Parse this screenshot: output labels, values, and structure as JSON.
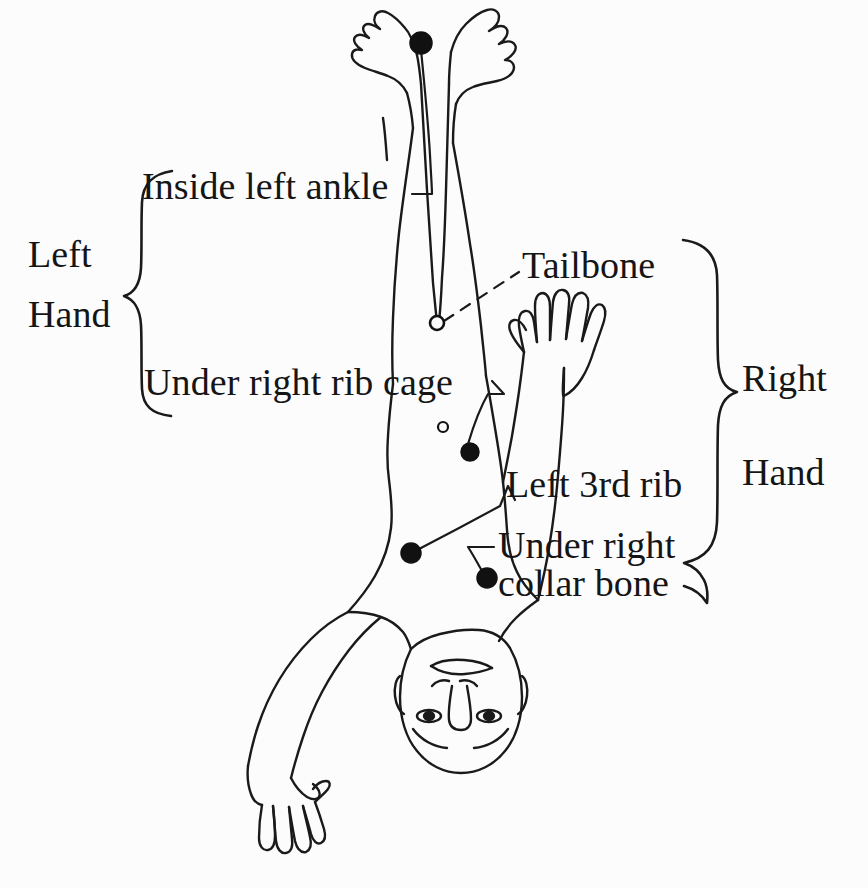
{
  "diagram": {
    "orientation": "inverted",
    "background_color": "#fcfcfc",
    "ink_color": "#151515"
  },
  "labels": {
    "inside_left_ankle": "Inside left ankle",
    "tailbone": "Tailbone",
    "under_right_rib_cage": "Under right rib cage",
    "left_3rd_rib": "Left 3rd rib",
    "under_right_collar_bone_line1": "Under right",
    "under_right_collar_bone_line2": "collar bone"
  },
  "braces": {
    "left": {
      "line1": "Left",
      "line2": "Hand",
      "groups": [
        "Inside left ankle",
        "Under right rib cage"
      ]
    },
    "right": {
      "line1": "Right",
      "line2": "Hand",
      "groups": [
        "Tailbone",
        "Left 3rd rib",
        "Under right collar bone"
      ]
    }
  },
  "markers": [
    {
      "name": "inside-left-ankle-point",
      "style": "filled",
      "x": 421,
      "y": 43,
      "r": 11
    },
    {
      "name": "tailbone-point",
      "style": "hollow",
      "x": 437,
      "y": 323,
      "r": 7
    },
    {
      "name": "small-hollow-point",
      "style": "hollow",
      "x": 443,
      "y": 427,
      "r": 5
    },
    {
      "name": "under-right-rib-cage-point",
      "style": "filled",
      "x": 470,
      "y": 452,
      "r": 9
    },
    {
      "name": "left-3rd-rib-point",
      "style": "filled",
      "x": 411,
      "y": 553,
      "r": 10
    },
    {
      "name": "under-right-collar-bone-point",
      "style": "filled",
      "x": 487,
      "y": 578,
      "r": 10
    }
  ],
  "leaders": [
    {
      "name": "leader-inside-left-ankle",
      "style": "solid",
      "from": "inside-left-ankle-point",
      "to": "Inside left ankle"
    },
    {
      "name": "leader-tailbone",
      "style": "dashed",
      "from": "tailbone-point",
      "to": "Tailbone"
    },
    {
      "name": "leader-rib-cage",
      "style": "solid",
      "from": "under-right-rib-cage-point",
      "to": "Under right rib cage"
    },
    {
      "name": "leader-left-3rd-rib",
      "style": "solid",
      "from": "left-3rd-rib-point",
      "to": "Left 3rd rib"
    },
    {
      "name": "leader-collar-bone",
      "style": "solid",
      "from": "under-right-collar-bone-point",
      "to": "Under right collar bone"
    }
  ]
}
